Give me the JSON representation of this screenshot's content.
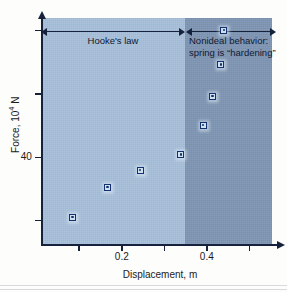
{
  "chart_data": {
    "type": "scatter",
    "title": "",
    "xlabel": "Displacement, m",
    "ylabel": "Force, 10⁴ N",
    "ylabel_base": "Force, 10",
    "ylabel_exp": "4",
    "ylabel_unit": " N",
    "xlim": [
      0.01,
      0.553
    ],
    "ylim": [
      26.0,
      62.0
    ],
    "grid": false,
    "legend": "none",
    "x_ticks": [
      0.1,
      0.2,
      0.3,
      0.4,
      0.5
    ],
    "x_tick_labels": [
      "",
      "0.2",
      "",
      "0.4",
      ""
    ],
    "y_ticks": [
      30,
      40,
      50,
      60
    ],
    "y_tick_labels": [
      "",
      "40",
      "",
      ""
    ],
    "x": [
      0.085,
      0.167,
      0.243,
      0.339,
      0.391,
      0.414,
      0.433,
      0.44
    ],
    "y": [
      30.5,
      35.3,
      38.0,
      40.4,
      45.1,
      49.6,
      54.6,
      60.0
    ],
    "points": [
      {
        "x": 0.085,
        "y": 30.5
      },
      {
        "x": 0.167,
        "y": 35.3
      },
      {
        "x": 0.243,
        "y": 38.0
      },
      {
        "x": 0.339,
        "y": 40.4
      },
      {
        "x": 0.391,
        "y": 45.1
      },
      {
        "x": 0.414,
        "y": 49.6
      },
      {
        "x": 0.433,
        "y": 54.6
      },
      {
        "x": 0.44,
        "y": 60.0
      }
    ],
    "regions": [
      {
        "name": "hookes-law",
        "x_start": 0.01,
        "x_end": 0.35,
        "fill": "#a8bfd9"
      },
      {
        "name": "nonideal",
        "x_start": 0.35,
        "x_end": 0.553,
        "fill": "#7f95b2"
      }
    ],
    "annotations": [
      {
        "name": "hookes-law",
        "text": "Hooke's law",
        "x_start": 0.01,
        "x_end": 0.35
      },
      {
        "name": "nonideal",
        "line1": "Nonideal behavior:",
        "line2": "spring is “hardening”",
        "x_start": 0.35,
        "x_end": 0.553
      }
    ],
    "colors": {
      "axis": "#16213c",
      "marker_edge": "#13316e",
      "marker_face": "#cfe0ee",
      "band_light": "#a8bfd9",
      "band_dark": "#7f95b2",
      "text": "#1b1b1b"
    }
  },
  "axes": {
    "y_tick_label_40": "40",
    "x_tick_label_02": "0.2",
    "x_tick_label_04": "0.4"
  },
  "annotations": {
    "hooke_label": "Hooke's law",
    "nonideal_line1": "Nonideal behavior:",
    "nonideal_line2": "spring is “hardening”"
  }
}
